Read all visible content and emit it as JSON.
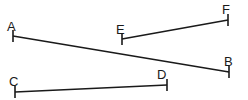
{
  "figure": {
    "type": "geometry-line-segments",
    "background_color": "#ffffff",
    "line_color": "#1a1a1a",
    "label_color": "#1a1a1a",
    "width": 248,
    "height": 100,
    "points": {
      "A": {
        "label": "A",
        "x": 13,
        "y": 36,
        "label_x": 7,
        "label_y": 20
      },
      "B": {
        "label": "B",
        "x": 229,
        "y": 72,
        "label_x": 224,
        "label_y": 55
      },
      "C": {
        "label": "C",
        "x": 15,
        "y": 92,
        "label_x": 9,
        "label_y": 75
      },
      "D": {
        "label": "D",
        "x": 167,
        "y": 85,
        "label_x": 157,
        "label_y": 68
      },
      "E": {
        "label": "E",
        "x": 122,
        "y": 39,
        "label_x": 116,
        "label_y": 23
      },
      "F": {
        "label": "F",
        "x": 228,
        "y": 20,
        "label_x": 222,
        "label_y": 3
      }
    },
    "segments": [
      {
        "name": "segment-ab",
        "from": "A",
        "to": "B",
        "x1": 13,
        "y1": 36,
        "x2": 229,
        "y2": 72
      },
      {
        "name": "segment-cd",
        "from": "C",
        "to": "D",
        "x1": 15,
        "y1": 92,
        "x2": 167,
        "y2": 85
      },
      {
        "name": "segment-ef",
        "from": "E",
        "to": "F",
        "x1": 122,
        "y1": 39,
        "x2": 228,
        "y2": 20
      }
    ],
    "endpoint_ticks": [
      {
        "name": "tick-a",
        "x": 13,
        "y1": 30,
        "y2": 42
      },
      {
        "name": "tick-b",
        "x": 229,
        "y1": 66,
        "y2": 78
      },
      {
        "name": "tick-c",
        "x": 15,
        "y1": 86,
        "y2": 98
      },
      {
        "name": "tick-d",
        "x": 167,
        "y1": 79,
        "y2": 91
      },
      {
        "name": "tick-e",
        "x": 122,
        "y1": 33,
        "y2": 45
      },
      {
        "name": "tick-f",
        "x": 228,
        "y1": 14,
        "y2": 26
      }
    ]
  }
}
